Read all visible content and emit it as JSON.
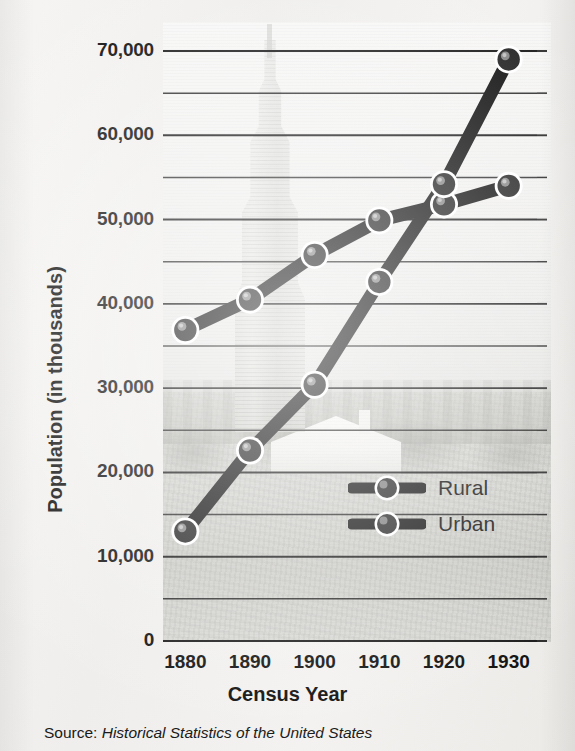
{
  "chart_data": {
    "type": "line",
    "title": "",
    "xlabel": "Census Year",
    "ylabel": "Population (in thousands)",
    "categories": [
      "1880",
      "1890",
      "1900",
      "1910",
      "1920",
      "1930"
    ],
    "x": [
      1880,
      1890,
      1900,
      1910,
      1920,
      1930
    ],
    "series": [
      {
        "name": "Rural",
        "values": [
          36900,
          40500,
          45800,
          49900,
          51800,
          54000
        ]
      },
      {
        "name": "Urban",
        "values": [
          13000,
          22600,
          30400,
          42600,
          54200,
          69000
        ]
      }
    ],
    "ylim": [
      0,
      70000
    ],
    "ytick_values": [
      0,
      10000,
      20000,
      30000,
      40000,
      50000,
      60000,
      70000
    ],
    "ytick_labels": [
      "0",
      "10,000",
      "20,000",
      "30,000",
      "40,000",
      "50,000",
      "60,000",
      "70,000"
    ],
    "gridline_interval": 5000,
    "grid": true,
    "legend_position": "inside-lower-right",
    "marker": "sphere-with-bar",
    "line_color": "#141414",
    "marker_halo_color": "#ffffff"
  },
  "source": {
    "prefix": "Source:",
    "publication": "Historical Statistics of the United States"
  },
  "legend": {
    "items": [
      {
        "label": "Rural"
      },
      {
        "label": "Urban"
      }
    ]
  },
  "background": {
    "description": "faded photograph of Empire State Building skyline over rural house",
    "paper_color": "#f2f1ef"
  }
}
